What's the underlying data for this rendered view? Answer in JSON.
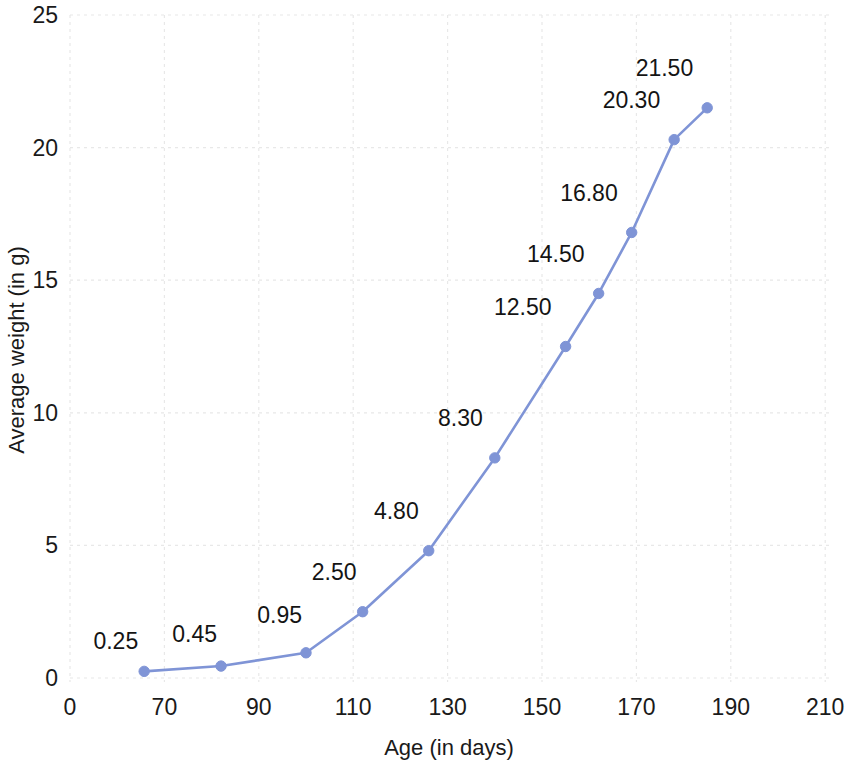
{
  "chart_data": {
    "type": "line",
    "title": "",
    "xlabel": "Age (in days)",
    "ylabel": "Average weight (in g)",
    "x": [
      55,
      82,
      100,
      112,
      126,
      140,
      155,
      162,
      169,
      178,
      185
    ],
    "values": [
      0.25,
      0.45,
      0.95,
      2.5,
      4.8,
      8.3,
      12.5,
      14.5,
      16.8,
      20.3,
      21.5
    ],
    "point_labels": [
      "0.25",
      "0.45",
      "0.95",
      "2.50",
      "4.80",
      "8.30",
      "12.50",
      "14.50",
      "16.80",
      "20.30",
      "21.50"
    ],
    "xticks": [
      0,
      70,
      90,
      110,
      130,
      150,
      170,
      190,
      210
    ],
    "xtick_labels": [
      "0",
      "70",
      "90",
      "110",
      "130",
      "150",
      "170",
      "190",
      "210"
    ],
    "yticks": [
      0,
      5,
      10,
      15,
      20,
      25
    ],
    "ytick_labels": [
      "0",
      "5",
      "10",
      "15",
      "20",
      "25"
    ],
    "ylim": [
      0,
      25
    ],
    "grid": true,
    "legend": "none",
    "series_color": "#7f94d6",
    "marker": "circle",
    "marker_color": "#7f94d6",
    "grid_color": "#e8e8e8",
    "text_color": "#1a1a1a"
  }
}
